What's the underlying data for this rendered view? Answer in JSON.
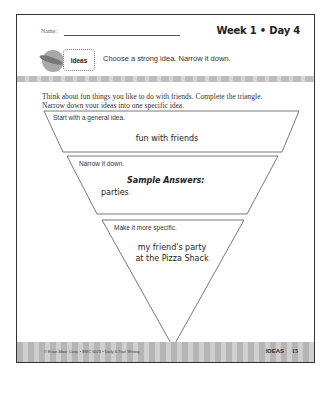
{
  "header": {
    "name_label": "Name:",
    "week_day": "Week 1 • Day 4"
  },
  "trait_badge": {
    "label": "Ideas",
    "icon": "feather-icon"
  },
  "prompt": "Choose a strong idea. Narrow it down.",
  "instructions": "Think about fun things you like to do with friends. Complete the triangle. Narrow down your ideas into one specific idea.",
  "triangle": {
    "levels": [
      {
        "label": "Start with a general idea.",
        "answer": "fun with friends"
      },
      {
        "label": "Narrow it down.",
        "heading": "Sample Answers:",
        "answer": "parties"
      },
      {
        "label": "Make it more specific.",
        "answer_line1": "my friend's party",
        "answer_line2": "at the Pizza Shack"
      }
    ]
  },
  "footer": {
    "copyright": "© Evan-Moor Corp. • EMC 6023 • Daily 6-Trait Writing",
    "section": "IDEAS",
    "page_number": "15"
  },
  "colors": {
    "border": "#333333",
    "stripe": "#bdbdbd"
  }
}
